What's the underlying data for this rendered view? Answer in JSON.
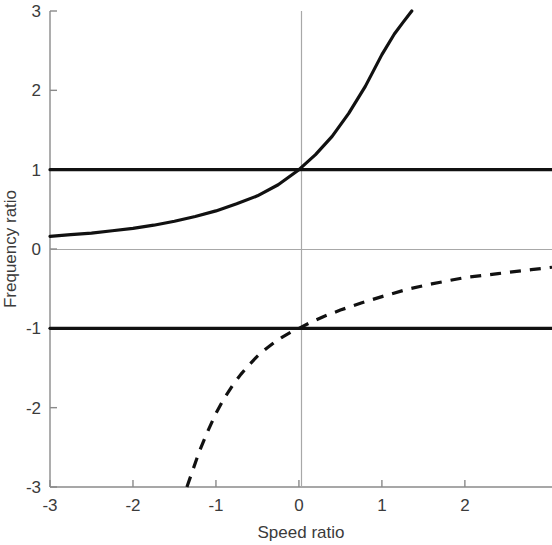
{
  "chart_data": {
    "type": "line",
    "title": "",
    "xlabel": "Speed ratio",
    "ylabel": "Frequency ratio",
    "xlim": [
      -3,
      3.05
    ],
    "ylim": [
      -3,
      3
    ],
    "xticks": [
      -3,
      -2,
      -1,
      0,
      1,
      2
    ],
    "xtick_labels": [
      "-3",
      "-2",
      "-1",
      "0",
      "1",
      "2"
    ],
    "yticks": [
      -3,
      -2,
      -1,
      0,
      1,
      2,
      3
    ],
    "ytick_labels": [
      "-3",
      "-2",
      "-1",
      "0",
      "1",
      "2",
      "3"
    ],
    "grid": false,
    "legend": "none",
    "axis_color": "#8a8a8a",
    "curve_color": "#111111",
    "series": [
      {
        "name": "upper-asymptote-line",
        "style": "solid",
        "linewidth": 3.2,
        "x": [
          -3,
          3.05
        ],
        "y": [
          1,
          1
        ]
      },
      {
        "name": "lower-asymptote-line",
        "style": "solid",
        "linewidth": 3.2,
        "x": [
          -3,
          3.05
        ],
        "y": [
          -1,
          -1
        ]
      },
      {
        "name": "approaching-frequency-ratio",
        "style": "solid",
        "linewidth": 3.2,
        "x": [
          -3.0,
          -2.75,
          -2.5,
          -2.25,
          -2.0,
          -1.75,
          -1.5,
          -1.25,
          -1.0,
          -0.75,
          -0.5,
          -0.25,
          0.0,
          0.2,
          0.4,
          0.6,
          0.8,
          1.0,
          1.15,
          1.25,
          1.36
        ],
        "y": [
          0.16,
          0.18,
          0.2,
          0.23,
          0.26,
          0.3,
          0.35,
          0.41,
          0.48,
          0.57,
          0.67,
          0.81,
          1.0,
          1.19,
          1.42,
          1.71,
          2.05,
          2.45,
          2.71,
          2.85,
          3.0
        ]
      },
      {
        "name": "receding-frequency-ratio",
        "style": "dashed",
        "linewidth": 3.2,
        "dash_pattern": "11 9",
        "x": [
          -1.35,
          -1.3,
          -1.2,
          -1.1,
          -1.0,
          -0.9,
          -0.8,
          -0.7,
          -0.6,
          -0.5,
          -0.4,
          -0.3,
          -0.2,
          -0.1,
          0.0,
          0.15,
          0.3,
          0.5,
          0.75,
          1.0,
          1.3,
          1.6,
          2.0,
          2.4,
          2.8,
          3.05
        ],
        "y": [
          -3.0,
          -2.85,
          -2.55,
          -2.3,
          -2.07,
          -1.88,
          -1.72,
          -1.58,
          -1.46,
          -1.35,
          -1.26,
          -1.18,
          -1.11,
          -1.05,
          -1.0,
          -0.92,
          -0.85,
          -0.77,
          -0.68,
          -0.6,
          -0.51,
          -0.44,
          -0.36,
          -0.31,
          -0.26,
          -0.23
        ]
      }
    ],
    "annotations": {
      "crossing_point_upper": {
        "x": 0,
        "y": 1
      },
      "crossing_point_lower": {
        "x": 0,
        "y": -1
      }
    }
  }
}
